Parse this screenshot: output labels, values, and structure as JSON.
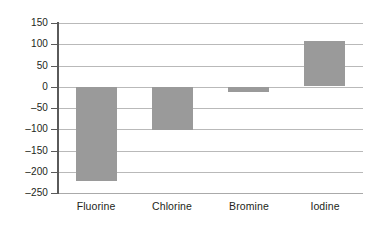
{
  "chart_data": {
    "type": "bar",
    "title": "",
    "subtitle": "",
    "xlabel": "",
    "ylabel": "",
    "categories": [
      "Fluorine",
      "Chlorine",
      "Bromine",
      "Iodine"
    ],
    "values": [
      -220,
      -100,
      -12,
      107
    ],
    "series": [
      {
        "name": "",
        "values": [
          -220,
          -100,
          -12,
          107
        ]
      }
    ],
    "ylim": [
      -250,
      150
    ],
    "ytick_values": [
      150,
      100,
      50,
      0,
      -50,
      -100,
      -150,
      -200,
      -250
    ],
    "ytick_labels": [
      "150",
      "100",
      "50",
      "0",
      "–50",
      "–100",
      "–150",
      "–200",
      "–250"
    ],
    "ytick_step": 50,
    "grid": true,
    "grid_axis": "y",
    "legend": false,
    "legend_position": "none",
    "annotations": [],
    "colors": {
      "bar_fill": "#9a9a9a",
      "gridline": "#b9b9b9",
      "axis": "#5a5a5a",
      "text": "#231f20",
      "background": "#ffffff"
    }
  }
}
